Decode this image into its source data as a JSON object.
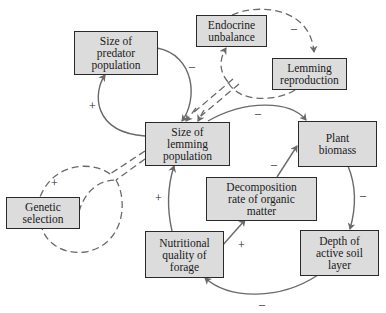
{
  "diagram": {
    "type": "causal-loop",
    "colors": {
      "box_fill": "#dcdcdc",
      "box_border": "#2a2a2a",
      "arrow": "#6a6a6a",
      "text": "#1a1a1a"
    },
    "nodes": {
      "predator": "Size of\npredator\npopulation",
      "endocrine": "Endocrine\nunbalance",
      "reproduction": "Lemming\nreproduction",
      "lemming": "Size of\nlemming\npopulation",
      "plant": "Plant\nbiomass",
      "decomposition": "Decomposition\nrate of organic\nmatter",
      "genetic": "Genetic\nselection",
      "nutrition": "Nutritional\nquality of\nforage",
      "soil": "Depth of\nactive soil\nlayer"
    },
    "signs": {
      "predator_to_lemming": "–",
      "lemming_to_predator": "+",
      "endocrine_to_reproduction": "–",
      "lemming_to_plant": "–",
      "decomposition_to_plant": "–",
      "plant_to_soil": "–",
      "soil_to_nutrition": "–",
      "nutrition_to_decomposition": "+",
      "nutrition_to_lemming": "+",
      "genetic_loop": "+"
    },
    "edges": [
      {
        "from": "predator",
        "to": "lemming",
        "sign": "–",
        "style": "solid"
      },
      {
        "from": "lemming",
        "to": "predator",
        "sign": "+",
        "style": "solid"
      },
      {
        "from": "lemming",
        "to": "endocrine",
        "sign": "",
        "style": "dashed"
      },
      {
        "from": "endocrine",
        "to": "reproduction",
        "sign": "–",
        "style": "dashed"
      },
      {
        "from": "reproduction",
        "to": "lemming",
        "sign": "",
        "style": "dashed"
      },
      {
        "from": "lemming",
        "to": "genetic",
        "sign": "+",
        "style": "dashed"
      },
      {
        "from": "genetic",
        "to": "lemming",
        "sign": "",
        "style": "dashed"
      },
      {
        "from": "lemming",
        "to": "plant",
        "sign": "–",
        "style": "solid"
      },
      {
        "from": "plant",
        "to": "soil",
        "sign": "–",
        "style": "solid"
      },
      {
        "from": "soil",
        "to": "nutrition",
        "sign": "–",
        "style": "solid"
      },
      {
        "from": "nutrition",
        "to": "decomposition",
        "sign": "+",
        "style": "solid"
      },
      {
        "from": "decomposition",
        "to": "plant",
        "sign": "–",
        "style": "solid"
      },
      {
        "from": "nutrition",
        "to": "lemming",
        "sign": "+",
        "style": "solid"
      }
    ]
  }
}
